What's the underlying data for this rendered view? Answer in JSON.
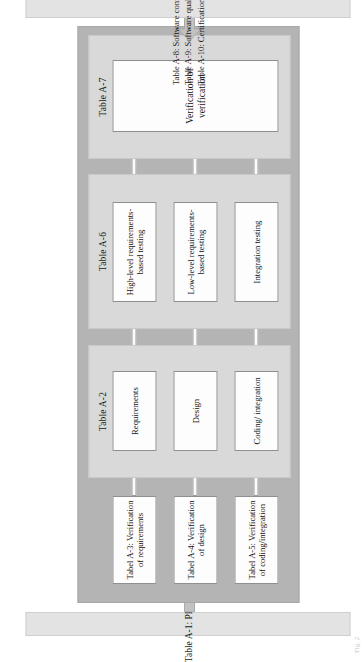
{
  "figure": {
    "orientation": "rotated-90-ccw",
    "caption": "Fig. 2"
  },
  "colors": {
    "container_fill": "#b4b4b4",
    "panel_fill": "#d9d9d9",
    "leaf_fill": "#fdfdfd",
    "side_box_fill": "#e3e3e3",
    "text": "#1a1a1a"
  },
  "side_left": {
    "label": "Table A-1: Planning"
  },
  "side_right": {
    "lines": [
      "Table A-8: Software configuration management",
      "Table A-9: Software quality assurance",
      "Table A-10: Certification liaison"
    ]
  },
  "arrows": {
    "left": {
      "name": "arrow-right-into-container",
      "direction": "right"
    },
    "right": {
      "name": "arrow-left-into-container",
      "direction": "left"
    }
  },
  "verification_column": {
    "boxes": [
      "Tabel A-3: Verification of requirements",
      "Tabel A-4: Verification of design",
      "Tabel A-5: Verification of coding/integration"
    ]
  },
  "panels": [
    {
      "id": "a2",
      "title": "Table A-2",
      "boxes": [
        "Requirements",
        "Design",
        "Coding/ integration"
      ]
    },
    {
      "id": "a6",
      "title": "Table A-6",
      "boxes": [
        "High-level requirements- based testing",
        "Low-level requirements- based testing",
        "Integration testing"
      ]
    },
    {
      "id": "a7",
      "title": "Table A-7",
      "boxes": [
        "Verification of verification"
      ]
    }
  ]
}
